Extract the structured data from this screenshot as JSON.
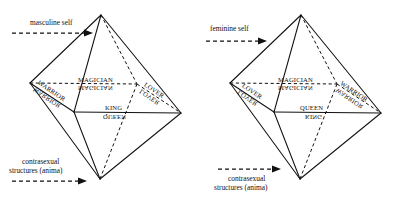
{
  "figure": {
    "background_color": "#ffffff",
    "line_color": "#111111"
  },
  "diagrams": [
    {
      "id": "masculine",
      "caption_top": "masculine self",
      "caption_bottom_line1": "contrasexual",
      "caption_bottom_line2": "structures (anima)",
      "caption_bottom_arrow_position": "below-text",
      "labels": {
        "top_center_upright": "MAGICIAN",
        "top_center_mirrored": "MAGICIAN",
        "mid_center_upright": "KING",
        "mid_center_mirrored": "QUEEN",
        "left_edge_upright": "WARRIOR",
        "left_edge_mirrored": "WARRIOR",
        "right_edge_upright": "LOVER",
        "right_edge_mirrored": "LOVER"
      }
    },
    {
      "id": "feminine",
      "caption_top": "feminine self",
      "caption_bottom_line1": "contrasexual",
      "caption_bottom_line2": "structures (anima)",
      "caption_bottom_arrow_position": "above-text",
      "labels": {
        "top_center_upright": "MAGICIAN",
        "top_center_mirrored": "MAGICIAN",
        "mid_center_upright": "QUEEN",
        "mid_center_mirrored": "KING",
        "left_edge_upright": "LOVER",
        "left_edge_mirrored": "LOVER",
        "right_edge_upright": "WARRIOR",
        "right_edge_mirrored": "WARRIOR"
      }
    }
  ],
  "geometry": {
    "vertex_top": "101,15",
    "vertex_bottom": "100,179",
    "vertex_left": "30,83",
    "vertex_right": "181,113",
    "vertex_front": "74,112",
    "vertex_back": "137,84"
  }
}
